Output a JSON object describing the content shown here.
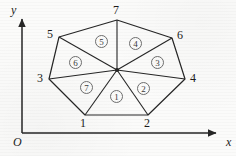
{
  "figure": {
    "background_color": "#fbfbfa",
    "stroke_color": "#262626",
    "axes": {
      "x_label": "x",
      "y_label": "y",
      "origin_label": "O",
      "origin": {
        "x": 22,
        "y": 133
      },
      "x_axis_end": {
        "x": 222,
        "y": 133
      },
      "y_axis_end": {
        "x": 22,
        "y": 13
      }
    },
    "center_node": {
      "x": 117,
      "y": 70,
      "radius": 2.1
    },
    "vertices": [
      {
        "id": "1",
        "label": "1",
        "x": 85,
        "y": 115,
        "label_x": 80,
        "label_y": 117
      },
      {
        "id": "2",
        "label": "2",
        "x": 148,
        "y": 115,
        "label_x": 144,
        "label_y": 117
      },
      {
        "id": "3",
        "label": "3",
        "x": 49,
        "y": 79,
        "label_x": 37,
        "label_y": 72
      },
      {
        "id": "4",
        "label": "4",
        "x": 185,
        "y": 79,
        "label_x": 190,
        "label_y": 72
      },
      {
        "id": "5",
        "label": "5",
        "x": 59,
        "y": 37,
        "label_x": 47,
        "label_y": 28
      },
      {
        "id": "6",
        "label": "6",
        "x": 172,
        "y": 38,
        "label_x": 177,
        "label_y": 29
      },
      {
        "id": "7",
        "label": "7",
        "x": 117,
        "y": 20,
        "label_x": 113,
        "label_y": 5
      }
    ],
    "boundary_order": [
      "1",
      "2",
      "4",
      "6",
      "7",
      "5",
      "3"
    ],
    "spokes_from_center_to": [
      "1",
      "2",
      "3",
      "4",
      "5",
      "6",
      "7"
    ],
    "faces": [
      {
        "label": "1",
        "x": 110,
        "y": 90
      },
      {
        "label": "2",
        "x": 137,
        "y": 82
      },
      {
        "label": "3",
        "x": 151,
        "y": 56
      },
      {
        "label": "4",
        "x": 129,
        "y": 37
      },
      {
        "label": "5",
        "x": 95,
        "y": 35
      },
      {
        "label": "6",
        "x": 69,
        "y": 56
      },
      {
        "label": "7",
        "x": 80,
        "y": 81
      }
    ]
  }
}
